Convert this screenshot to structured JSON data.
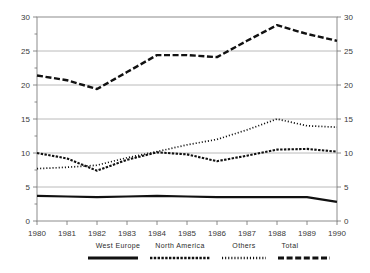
{
  "chart_data": {
    "type": "line",
    "title": "",
    "subtitle": "",
    "xlabel": "",
    "ylabel": "",
    "x": [
      1980,
      1981,
      1982,
      1983,
      1984,
      1985,
      1986,
      1987,
      1988,
      1989,
      1990
    ],
    "categories": [
      "1980",
      "1981",
      "1982",
      "1983",
      "1984",
      "1985",
      "1986",
      "1987",
      "1988",
      "1989",
      "1990"
    ],
    "xlim": [
      1980,
      1990
    ],
    "ylim": [
      0,
      30
    ],
    "yticks": [
      0,
      5,
      10,
      15,
      20,
      25,
      30
    ],
    "ytick_labels": [
      "0",
      "5",
      "10",
      "15",
      "20",
      "25",
      "30"
    ],
    "grid": true,
    "dual_y_axis": true,
    "legend_position": "bottom",
    "series": [
      {
        "name": "West Europe",
        "style": "solid",
        "color": "#111111",
        "values": [
          3.7,
          3.6,
          3.5,
          3.6,
          3.7,
          3.6,
          3.5,
          3.5,
          3.5,
          3.5,
          2.8
        ]
      },
      {
        "name": "North America",
        "style": "dashed-fine",
        "color": "#111111",
        "values": [
          10.0,
          9.2,
          7.4,
          9.0,
          10.1,
          9.8,
          8.8,
          9.6,
          10.5,
          10.6,
          10.2
        ]
      },
      {
        "name": "Others",
        "style": "dotted",
        "color": "#111111",
        "values": [
          7.7,
          7.9,
          8.2,
          9.3,
          10.2,
          11.2,
          12.0,
          13.4,
          15.0,
          14.0,
          13.8
        ]
      },
      {
        "name": "Total",
        "style": "dashed-coarse",
        "color": "#111111",
        "values": [
          21.4,
          20.7,
          19.4,
          21.9,
          24.4,
          24.4,
          24.1,
          26.5,
          28.8,
          27.5,
          26.5
        ]
      }
    ]
  },
  "legend": {
    "entries": [
      {
        "label": "West Europe",
        "style": "solid"
      },
      {
        "label": "North America",
        "style": "dashed-fine"
      },
      {
        "label": "Others",
        "style": "dotted"
      },
      {
        "label": "Total",
        "style": "dashed-coarse"
      }
    ]
  },
  "axes": {
    "left_tick_labels": [
      "30",
      "25",
      "20",
      "15",
      "10",
      "5",
      "0"
    ],
    "right_tick_labels": [
      "30",
      "25",
      "20",
      "15",
      "10",
      "5",
      "0"
    ],
    "x_tick_labels": [
      "1980",
      "1981",
      "1982",
      "1983",
      "1984",
      "1985",
      "1986",
      "1987",
      "1988",
      "1989",
      "1990"
    ]
  },
  "colors": {
    "background": "#ffffff",
    "ink": "#111111",
    "grid": "#a8a8a8",
    "frame": "#8c8c8c",
    "tick_text": "#3a3a3a"
  }
}
